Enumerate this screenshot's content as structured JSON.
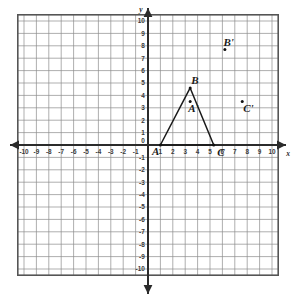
{
  "figure": {
    "axis_names": {
      "x": "x",
      "y": "y"
    },
    "x_ticks": [
      "-10",
      "-9",
      "-8",
      "-7",
      "-6",
      "-5",
      "-4",
      "-3",
      "-2",
      "-1",
      "0",
      "1",
      "2",
      "3",
      "4",
      "5",
      "6",
      "7",
      "8",
      "9",
      "10"
    ],
    "y_ticks": [
      "10",
      "9",
      "8",
      "7",
      "6",
      "5",
      "4",
      "3",
      "2",
      "1",
      "0",
      "-1",
      "-2",
      "-3",
      "-4",
      "-5",
      "-6",
      "-7",
      "-8",
      "-9",
      "-10"
    ],
    "x_range": [
      -10.5,
      10.5
    ],
    "y_range": [
      -10.5,
      10.5
    ],
    "grid": true,
    "colors": {
      "grid_line": "#8c8c8c",
      "grid_border": "#555555",
      "axis": "#2b2b2b",
      "shape_stroke": "#1a1a1a",
      "point_fill": "#111111",
      "background": "#ffffff"
    },
    "triangle": {
      "name": "triangle-ABC",
      "vertices": [
        {
          "label": "A",
          "x": 1.0,
          "y": 0.0
        },
        {
          "label": "B",
          "x": 3.4,
          "y": 4.6
        },
        {
          "label": "C",
          "x": 5.3,
          "y": 0.0
        }
      ]
    },
    "image_points": [
      {
        "label": "A'",
        "x": 3.4,
        "y": 3.5
      },
      {
        "label": "B'",
        "x": 6.2,
        "y": 7.7
      },
      {
        "label": "C'",
        "x": 7.6,
        "y": 3.5
      }
    ]
  }
}
